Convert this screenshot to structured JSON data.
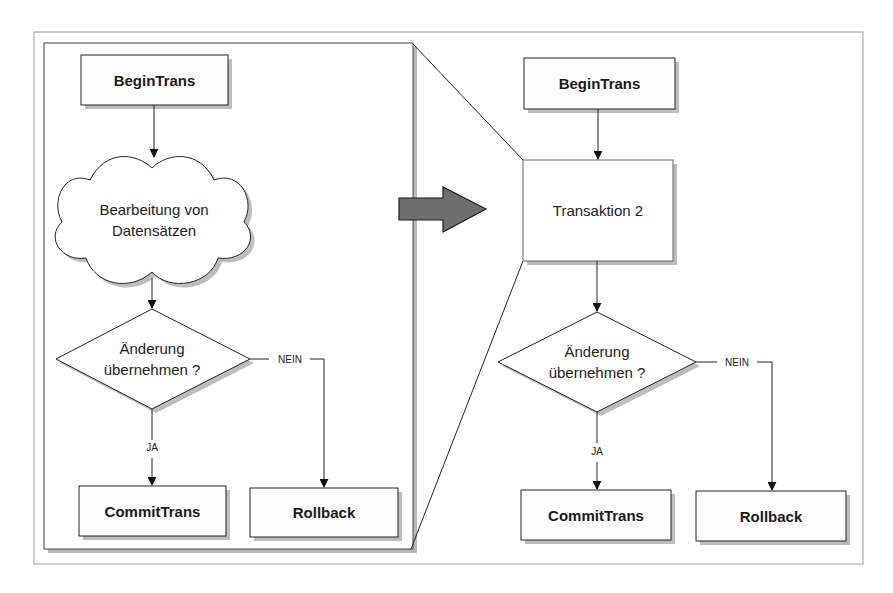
{
  "diagram": {
    "left_panel": {
      "begin": "BeginTrans",
      "process_line1": "Bearbeitung von",
      "process_line2": "Datensätzen",
      "decision_line1": "Änderung",
      "decision_line2": "übernehmen ?",
      "yes_label": "JA",
      "no_label": "NEIN",
      "commit": "CommitTrans",
      "rollback": "Rollback"
    },
    "right_panel": {
      "begin": "BeginTrans",
      "process": "Transaktion 2",
      "decision_line1": "Änderung",
      "decision_line2": "übernehmen ?",
      "yes_label": "JA",
      "no_label": "NEIN",
      "commit": "CommitTrans",
      "rollback": "Rollback"
    },
    "colors": {
      "stroke": "#222222",
      "shadow": "#b5b5b5",
      "arrow_fill": "#6e6e6e",
      "frame": "#9a9a9a"
    }
  }
}
